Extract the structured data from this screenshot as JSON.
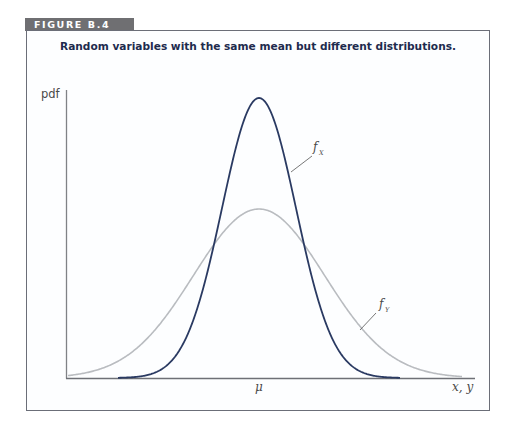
{
  "figure": {
    "tab_label": "FIGURE B.4",
    "title": "Random variables with the same mean but different distributions."
  },
  "chart_data": {
    "type": "line",
    "title": "Random variables with the same mean but different distributions.",
    "xlabel": "x, y",
    "ylabel": "pdf",
    "x_tick_labels": [
      "μ"
    ],
    "grid": false,
    "legend": "inline labels",
    "series": [
      {
        "name": "f_X",
        "label_main": "f",
        "label_sub": "X",
        "color": "#2a3a62",
        "description": "Narrow, tall bell curve centered at μ",
        "mean": "μ",
        "relative_peak": 1.0,
        "relative_spread": 1.0
      },
      {
        "name": "f_Y",
        "label_main": "f",
        "label_sub": "Y",
        "color": "#b9bcc0",
        "description": "Wide, short bell curve centered at μ",
        "mean": "μ",
        "relative_peak": 0.6,
        "relative_spread": 1.77
      }
    ]
  },
  "render": {
    "center_px": 259,
    "baseline_px": 378,
    "x_axis_start": 66,
    "x_axis_end": 475,
    "y_axis_top": 90,
    "fx": {
      "peak_px": 280,
      "sigma_px": 37,
      "x_from": 118,
      "x_to": 400
    },
    "fy": {
      "peak_px": 169,
      "sigma_px": 65.6,
      "x_from": 68,
      "x_to": 462
    }
  }
}
